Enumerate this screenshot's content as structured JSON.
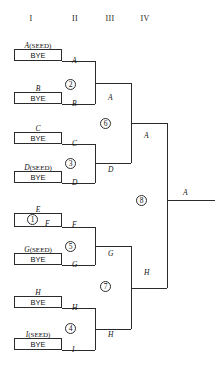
{
  "diagram": {
    "line_color": "#2b2b2b",
    "text_color": "#111111",
    "background": "#ffffff"
  },
  "rounds": [
    {
      "numeral": "I",
      "x": 31,
      "y": 14
    },
    {
      "numeral": "II",
      "x": 75,
      "y": 14
    },
    {
      "numeral": "III",
      "x": 110,
      "y": 14
    },
    {
      "numeral": "IV",
      "x": 145,
      "y": 14
    }
  ],
  "entrants": [
    {
      "id": "A",
      "label": "A",
      "seed": "(SEED)",
      "slot_text": "BYE",
      "name_x": 14,
      "name_y": 41,
      "box_x": 14,
      "box_y": 49,
      "box_w": 48,
      "box_h": 12
    },
    {
      "id": "B",
      "label": "B",
      "seed": "",
      "slot_text": "BYE",
      "name_x": 14,
      "name_y": 84,
      "box_x": 14,
      "box_y": 92,
      "box_w": 48,
      "box_h": 12
    },
    {
      "id": "C",
      "label": "C",
      "seed": "",
      "slot_text": "BYE",
      "name_x": 14,
      "name_y": 124,
      "box_x": 14,
      "box_y": 132,
      "box_w": 48,
      "box_h": 12
    },
    {
      "id": "D",
      "label": "D",
      "seed": "(SEED)",
      "slot_text": "BYE",
      "name_x": 14,
      "name_y": 163,
      "box_x": 14,
      "box_y": 171,
      "box_w": 48,
      "box_h": 12
    },
    {
      "id": "E",
      "label": "E",
      "seed": "",
      "slot_text": "",
      "name_x": 14,
      "name_y": 205,
      "box_x": 14,
      "box_y": 213,
      "box_w": 48,
      "box_h": 14
    },
    {
      "id": "G",
      "label": "G",
      "seed": "(SEED)",
      "slot_text": "BYE",
      "name_x": 14,
      "name_y": 245,
      "box_x": 14,
      "box_y": 253,
      "box_w": 48,
      "box_h": 12
    },
    {
      "id": "H",
      "label": "H",
      "seed": "",
      "slot_text": "BYE",
      "name_x": 14,
      "name_y": 288,
      "box_x": 14,
      "box_y": 296,
      "box_w": 48,
      "box_h": 12
    },
    {
      "id": "I",
      "label": "I",
      "seed": "(SEED)",
      "slot_text": "BYE",
      "name_x": 14,
      "name_y": 330,
      "box_x": 14,
      "box_y": 338,
      "box_w": 48,
      "box_h": 12
    }
  ],
  "matches": [
    {
      "number": "1",
      "round": 1,
      "competitors": [
        "E",
        "F"
      ],
      "winner": "F",
      "circle_x": 27,
      "circle_y": 214,
      "inline_opponent": "F"
    },
    {
      "number": "2",
      "round": 2,
      "competitors": [
        "A",
        "B"
      ],
      "winner": "A",
      "circle_x": 65,
      "circle_y": 79
    },
    {
      "number": "3",
      "round": 2,
      "competitors": [
        "C",
        "D"
      ],
      "winner": "D",
      "circle_x": 65,
      "circle_y": 158
    },
    {
      "number": "4",
      "round": 2,
      "competitors": [
        "H",
        "I"
      ],
      "winner": "I",
      "circle_x": 65,
      "circle_y": 323
    },
    {
      "number": "5",
      "round": 2,
      "competitors": [
        "F",
        "G"
      ],
      "winner": "G",
      "circle_x": 65,
      "circle_y": 241
    },
    {
      "number": "6",
      "round": 3,
      "competitors": [
        "A",
        "D"
      ],
      "winner": "A",
      "circle_x": 100,
      "circle_y": 118
    },
    {
      "number": "7",
      "round": 3,
      "competitors": [
        "G",
        "H"
      ],
      "winner": "H",
      "circle_x": 100,
      "circle_y": 281
    },
    {
      "number": "8",
      "round": 4,
      "competitors": [
        "A",
        "H"
      ],
      "winner": "A",
      "circle_x": 136,
      "circle_y": 195
    }
  ],
  "winner_labels": [
    {
      "text": "A",
      "x": 72,
      "y": 56,
      "note": "A advances from round I bye"
    },
    {
      "text": "B",
      "x": 72,
      "y": 99,
      "note": "B advances from round I bye"
    },
    {
      "text": "C",
      "x": 72,
      "y": 139,
      "note": "C advances from round I bye"
    },
    {
      "text": "D",
      "x": 72,
      "y": 178,
      "note": "D advances from round I bye"
    },
    {
      "text": "F",
      "x": 72,
      "y": 220,
      "note": "F wins match 1"
    },
    {
      "text": "G",
      "x": 72,
      "y": 260,
      "note": "G advances from round I bye"
    },
    {
      "text": "H",
      "x": 72,
      "y": 303,
      "note": "H advances from round I bye"
    },
    {
      "text": "I",
      "x": 72,
      "y": 345,
      "note": "I advances from round I bye"
    },
    {
      "text": "A",
      "x": 108,
      "y": 93,
      "note": "A wins match 2"
    },
    {
      "text": "D",
      "x": 108,
      "y": 165,
      "note": "D wins match 3"
    },
    {
      "text": "G",
      "x": 108,
      "y": 249,
      "note": "G wins match 5"
    },
    {
      "text": "H",
      "x": 108,
      "y": 330,
      "note": "H wins match 4 bracket line"
    },
    {
      "text": "A",
      "x": 144,
      "y": 131,
      "note": "A wins match 6"
    },
    {
      "text": "H",
      "x": 144,
      "y": 268,
      "note": "H wins match 7"
    },
    {
      "text": "A",
      "x": 183,
      "y": 188,
      "note": "A wins the tournament"
    }
  ],
  "inline_labels": [
    {
      "text": "F",
      "x": 45,
      "y": 219,
      "note": "opponent F inside match 1 box"
    }
  ],
  "connectors": [
    {
      "type": "h",
      "x": 62,
      "y": 61,
      "len": 33
    },
    {
      "type": "h",
      "x": 62,
      "y": 104,
      "len": 33
    },
    {
      "type": "v",
      "x": 95,
      "y": 61,
      "len": 43
    },
    {
      "type": "h",
      "x": 95,
      "y": 83,
      "len": 36
    },
    {
      "type": "h",
      "x": 62,
      "y": 144,
      "len": 33
    },
    {
      "type": "h",
      "x": 62,
      "y": 183,
      "len": 33
    },
    {
      "type": "v",
      "x": 95,
      "y": 144,
      "len": 39
    },
    {
      "type": "h",
      "x": 95,
      "y": 163,
      "len": 36
    },
    {
      "type": "v",
      "x": 131,
      "y": 83,
      "len": 80
    },
    {
      "type": "h",
      "x": 131,
      "y": 123,
      "len": 36
    },
    {
      "type": "h",
      "x": 62,
      "y": 227,
      "len": 33
    },
    {
      "type": "h",
      "x": 62,
      "y": 265,
      "len": 33
    },
    {
      "type": "v",
      "x": 95,
      "y": 227,
      "len": 38
    },
    {
      "type": "h",
      "x": 95,
      "y": 246,
      "len": 36
    },
    {
      "type": "h",
      "x": 62,
      "y": 308,
      "len": 33
    },
    {
      "type": "h",
      "x": 62,
      "y": 350,
      "len": 33
    },
    {
      "type": "v",
      "x": 95,
      "y": 308,
      "len": 42
    },
    {
      "type": "h",
      "x": 95,
      "y": 329,
      "len": 36
    },
    {
      "type": "v",
      "x": 131,
      "y": 246,
      "len": 83
    },
    {
      "type": "h",
      "x": 131,
      "y": 288,
      "len": 36
    },
    {
      "type": "v",
      "x": 167,
      "y": 123,
      "len": 165
    },
    {
      "type": "h",
      "x": 167,
      "y": 200,
      "len": 48
    }
  ]
}
